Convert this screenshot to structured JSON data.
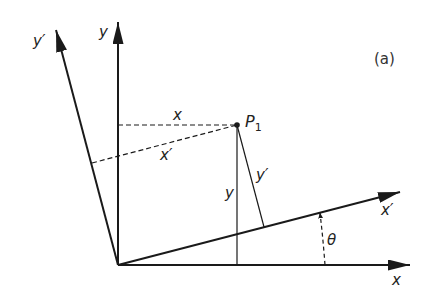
{
  "figure": {
    "panel_label": "(a)",
    "colors": {
      "ink": "#1a1a1a",
      "background": "#ffffff"
    }
  },
  "axes": {
    "x": {
      "label": "x"
    },
    "y": {
      "label": "y"
    },
    "x_prime": {
      "label": "x′"
    },
    "y_prime": {
      "label": "y′"
    }
  },
  "point": {
    "name": "P",
    "subscript": "1"
  },
  "components": {
    "x": "x",
    "x_prime": "x′",
    "y": "y",
    "y_prime": "y′"
  },
  "angle": {
    "label": "θ"
  }
}
